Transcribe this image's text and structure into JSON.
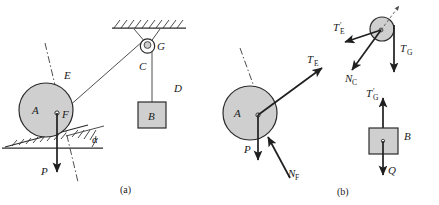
{
  "figure": {
    "panels": [
      {
        "id": "a",
        "caption": "(a)"
      },
      {
        "id": "b",
        "caption": "(b)"
      }
    ],
    "colors": {
      "body_fill": "#cfcfcf",
      "line": "#2b2b2b",
      "arrow": "#1f1f1f",
      "background": "#ffffff"
    }
  },
  "panel_a": {
    "caption": "(a)",
    "labels": {
      "cylinder": "A",
      "center": "F",
      "rope_upper": "E",
      "rope_pulley_side": "C",
      "rope_block": "D",
      "pulley": "G",
      "block": "B",
      "weight": "P",
      "angle": "α"
    },
    "elements": {
      "cylinder_name": "cylinder-A",
      "center_point_name": "center-point-F",
      "rope_E_name": "rope-E",
      "rope_C_name": "rope-C",
      "rope_D_name": "rope-D",
      "pulley_G_name": "pulley-G",
      "block_B_name": "block-B",
      "incline_name": "inclined-wedge",
      "ground_name": "ground-line",
      "ceiling_name": "hatched-ceiling",
      "bracket_name": "pulley-bracket",
      "weight_arrow_name": "weight-arrow-P",
      "axis_name": "incline-normal-axis"
    }
  },
  "panel_b": {
    "caption": "(b)",
    "free_bodies": [
      {
        "name": "cylinder-free-body",
        "body_label": "A",
        "forces": [
          {
            "symbol": "T",
            "sub": "E",
            "prime": false,
            "name": "force-TE"
          },
          {
            "symbol": "P",
            "sub": "",
            "prime": false,
            "name": "force-P"
          },
          {
            "symbol": "N",
            "sub": "F",
            "prime": false,
            "name": "force-NF"
          }
        ]
      },
      {
        "name": "pulley-free-body",
        "body_label": "",
        "forces": [
          {
            "symbol": "T",
            "sub": "E",
            "prime": true,
            "name": "force-TE-prime"
          },
          {
            "symbol": "N",
            "sub": "C",
            "prime": false,
            "name": "force-NC"
          },
          {
            "symbol": "T",
            "sub": "G",
            "prime": false,
            "name": "force-TG"
          }
        ]
      },
      {
        "name": "block-free-body",
        "body_label": "B",
        "forces": [
          {
            "symbol": "T",
            "sub": "G",
            "prime": true,
            "name": "force-TG-prime"
          },
          {
            "symbol": "Q",
            "sub": "",
            "prime": false,
            "name": "force-Q"
          }
        ]
      }
    ],
    "labels": {
      "TE": "T",
      "TE_sub": "E",
      "P": "P",
      "NF": "N",
      "NF_sub": "F",
      "TE_prime": "T",
      "TE_prime_sub": "E",
      "NC": "N",
      "NC_sub": "C",
      "TG": "T",
      "TG_sub": "G",
      "TG_prime": "T",
      "TG_prime_sub": "G",
      "Q": "Q",
      "block": "B",
      "cylinder": "A",
      "prime_mark": "′"
    }
  }
}
